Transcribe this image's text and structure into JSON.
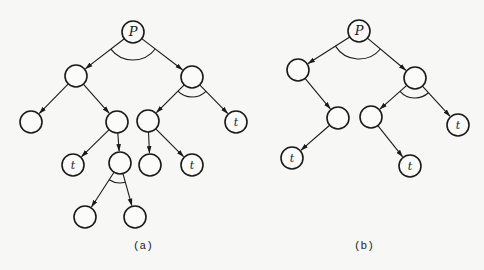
{
  "diagram": {
    "type": "AND/OR tree (solution graphs)",
    "node_radius": 11,
    "colors": {
      "stroke": "#1a1a1a",
      "background": "#f7f7f5"
    },
    "trees": [
      {
        "id": "a",
        "caption": "(a)",
        "caption_pos": [
          142,
          247
        ],
        "nodes": [
          {
            "id": "P",
            "x": 133,
            "y": 32,
            "label": "P"
          },
          {
            "id": "a1",
            "x": 76,
            "y": 76,
            "label": ""
          },
          {
            "id": "a2",
            "x": 192,
            "y": 77,
            "label": ""
          },
          {
            "id": "a11",
            "x": 31,
            "y": 122,
            "label": ""
          },
          {
            "id": "a12",
            "x": 117,
            "y": 122,
            "label": ""
          },
          {
            "id": "a21",
            "x": 148,
            "y": 121,
            "label": ""
          },
          {
            "id": "a22",
            "x": 236,
            "y": 122,
            "label": "t"
          },
          {
            "id": "a121",
            "x": 73,
            "y": 165,
            "label": "t"
          },
          {
            "id": "a122",
            "x": 120,
            "y": 163,
            "label": ""
          },
          {
            "id": "a211",
            "x": 150,
            "y": 165,
            "label": ""
          },
          {
            "id": "a212",
            "x": 192,
            "y": 165,
            "label": "t"
          },
          {
            "id": "a1221",
            "x": 85,
            "y": 217,
            "label": ""
          },
          {
            "id": "a1222",
            "x": 135,
            "y": 217,
            "label": ""
          }
        ],
        "edges": [
          [
            "P",
            "a1"
          ],
          [
            "P",
            "a2"
          ],
          [
            "a1",
            "a11"
          ],
          [
            "a1",
            "a12"
          ],
          [
            "a2",
            "a21"
          ],
          [
            "a2",
            "a22"
          ],
          [
            "a12",
            "a121"
          ],
          [
            "a12",
            "a122"
          ],
          [
            "a21",
            "a211"
          ],
          [
            "a21",
            "a212"
          ],
          [
            "a122",
            "a1221"
          ],
          [
            "a122",
            "a1222"
          ]
        ],
        "and_arcs": [
          "P",
          "a2",
          "a122"
        ]
      },
      {
        "id": "b",
        "caption": "(b)",
        "caption_pos": [
          363,
          247
        ],
        "nodes": [
          {
            "id": "P",
            "x": 359,
            "y": 31,
            "label": "P"
          },
          {
            "id": "b1",
            "x": 298,
            "y": 70,
            "label": ""
          },
          {
            "id": "b2",
            "x": 415,
            "y": 78,
            "label": ""
          },
          {
            "id": "b11",
            "x": 338,
            "y": 118,
            "label": ""
          },
          {
            "id": "b21",
            "x": 371,
            "y": 117,
            "label": ""
          },
          {
            "id": "b22",
            "x": 458,
            "y": 125,
            "label": "t"
          },
          {
            "id": "b111",
            "x": 292,
            "y": 158,
            "label": "t"
          },
          {
            "id": "b211",
            "x": 410,
            "y": 166,
            "label": "t"
          }
        ],
        "edges": [
          [
            "P",
            "b1"
          ],
          [
            "P",
            "b2"
          ],
          [
            "b1",
            "b11"
          ],
          [
            "b2",
            "b21"
          ],
          [
            "b2",
            "b22"
          ],
          [
            "b11",
            "b111"
          ],
          [
            "b21",
            "b211"
          ]
        ],
        "and_arcs": [
          "P",
          "b2"
        ]
      }
    ]
  }
}
